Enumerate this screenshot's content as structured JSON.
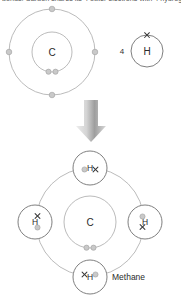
{
  "caption": {
    "text": "bonds. Carbon shares its 4 outer electrons with 4 hydrogen atoms."
  },
  "colors": {
    "background": "#ffffff",
    "shell_stroke": "#a9a9a9",
    "hydrogen_stroke": "#707070",
    "electron_dot_fill": "#c9c9c9",
    "electron_cross_stroke": "#3a3a3a",
    "arrow_light": "#e8e8e8",
    "arrow_dark": "#8c8c8c",
    "text": "#2b2b2b"
  },
  "reactants": {
    "carbon_atom": {
      "symbol": "C",
      "center": {
        "x": 52,
        "y": 52
      },
      "inner_shell_radius": 20,
      "outer_shell_radius": 43,
      "inner_electrons": [
        {
          "kind": "dot",
          "angle_deg": 100
        },
        {
          "kind": "dot",
          "angle_deg": 80
        }
      ],
      "outer_electrons": [
        {
          "kind": "dot",
          "angle_deg": 270
        },
        {
          "kind": "dot",
          "angle_deg": 180
        },
        {
          "kind": "dot",
          "angle_deg": 0
        },
        {
          "kind": "dot",
          "angle_deg": 90
        }
      ]
    },
    "hydrogen_atom": {
      "symbol": "H",
      "count_label": "4",
      "count_position": {
        "x": 122,
        "y": 51
      },
      "center": {
        "x": 147,
        "y": 51
      },
      "radius": 16,
      "electrons": [
        {
          "kind": "cross",
          "angle_deg": 270
        }
      ]
    }
  },
  "arrow": {
    "name": "reaction-arrow",
    "direction": "down",
    "x": 91,
    "top": 100,
    "bottom": 142
  },
  "product": {
    "name_label": "Methane",
    "name_label_position": {
      "x": 112,
      "y": 277
    },
    "carbon_atom": {
      "symbol": "C",
      "center": {
        "x": 90,
        "y": 222
      },
      "inner_shell_radius": 26,
      "outer_shell_radius": 54,
      "inner_electrons": [
        {
          "kind": "dot",
          "angle_deg": 97
        },
        {
          "kind": "dot",
          "angle_deg": 83
        }
      ]
    },
    "hydrogen_atoms": [
      {
        "symbol": "H",
        "position": "top",
        "center": {
          "x": 90,
          "y": 168
        },
        "radius": 17
      },
      {
        "symbol": "H",
        "position": "left",
        "center": {
          "x": 35,
          "y": 222
        },
        "radius": 17
      },
      {
        "symbol": "H",
        "position": "right",
        "center": {
          "x": 145,
          "y": 222
        },
        "radius": 17
      },
      {
        "symbol": "H",
        "position": "bottom",
        "center": {
          "x": 90,
          "y": 277
        },
        "radius": 17
      }
    ],
    "bond_pairs": [
      {
        "position": "top",
        "dot": {
          "x": 84.5,
          "y": 169.5
        },
        "cross": {
          "x": 95.5,
          "y": 169.5
        }
      },
      {
        "position": "left",
        "dot": {
          "x": 37.5,
          "y": 227.0
        },
        "cross": {
          "x": 37.5,
          "y": 216.5
        }
      },
      {
        "position": "right",
        "dot": {
          "x": 142.5,
          "y": 216.5
        },
        "cross": {
          "x": 142.5,
          "y": 227.0
        }
      },
      {
        "position": "bottom",
        "dot": {
          "x": 95.5,
          "y": 274.5
        },
        "cross": {
          "x": 84.5,
          "y": 274.5
        }
      }
    ]
  }
}
